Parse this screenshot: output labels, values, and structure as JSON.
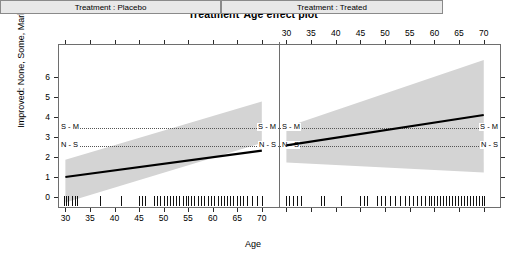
{
  "title": "Treatment*Age effect plot",
  "axes": {
    "xlabel": "Age",
    "ylabel": "Improved: None, Some, Marked",
    "x_ticks": [
      30,
      35,
      40,
      45,
      50,
      55,
      60,
      65,
      70
    ],
    "y_ticks": [
      0,
      1,
      2,
      3,
      4,
      5,
      6
    ],
    "xlim": [
      28.5,
      73.5
    ],
    "ylim": [
      -0.55,
      6.95
    ],
    "bottom_labels_panel": "left",
    "top_labels_panel": "right",
    "grid": false
  },
  "panels": [
    {
      "id": "placebo",
      "strip_label": "Treatment : Placebo"
    },
    {
      "id": "treated",
      "strip_label": "Treatment : Treated"
    }
  ],
  "thresholds": [
    {
      "label": "S - M",
      "value": 3.45
    },
    {
      "label": "N - S",
      "value": 2.55
    }
  ],
  "colors": {
    "line": "#000000",
    "band": "#d4d4d4",
    "strip_bg": "#e8e8e8",
    "frame": "#6e6e6e",
    "threshold": "#555555",
    "rug": "#111111"
  },
  "chart_data": {
    "type": "line",
    "title": "Treatment*Age effect plot",
    "xlabel": "Age",
    "ylabel": "Improved: None, Some, Marked",
    "xlim": [
      28.5,
      73.5
    ],
    "ylim": [
      -0.55,
      6.95
    ],
    "xticks": [
      30,
      35,
      40,
      45,
      50,
      55,
      60,
      65,
      70
    ],
    "yticks": [
      0,
      1,
      2,
      3,
      4,
      5,
      6
    ],
    "grid": false,
    "legend": "none",
    "facet_variable": "Treatment",
    "annotations": [
      {
        "text": "S - M",
        "y": 3.45,
        "style": "dotted-hline"
      },
      {
        "text": "N - S",
        "y": 2.55,
        "style": "dotted-hline"
      }
    ],
    "series": [
      {
        "name": "Treatment : Placebo",
        "panel": "placebo",
        "x": [
          30,
          70
        ],
        "values": [
          1.0,
          2.32
        ],
        "band_upper": [
          1.86,
          4.78
        ],
        "band_lower": [
          -0.28,
          2.7
        ],
        "band_label": "95% confidence band"
      },
      {
        "name": "Treatment : Treated",
        "panel": "treated",
        "x": [
          30,
          70
        ],
        "values": [
          2.58,
          4.1
        ],
        "band_upper": [
          3.5,
          6.85
        ],
        "band_lower": [
          1.72,
          1.22
        ],
        "band_label": "95% confidence band"
      }
    ],
    "rug_placebo": [
      29.8,
      30.2,
      30.6,
      31.4,
      32.0,
      32.4,
      37.1,
      41.4,
      45.0,
      45.6,
      46.2,
      48.0,
      48.6,
      49.2,
      50.0,
      50.6,
      51.2,
      52.0,
      52.6,
      53.2,
      54.0,
      54.6,
      55.0,
      55.6,
      56.2,
      57.0,
      57.6,
      58.2,
      59.0,
      59.6,
      60.2,
      61.0,
      61.6,
      62.2,
      63.0,
      63.6,
      64.2,
      65.0,
      65.6,
      66.2,
      67.0,
      68.0,
      69.0,
      70.0
    ],
    "rug_treated": [
      29.9,
      30.6,
      31.4,
      32.2,
      33.0,
      37.0,
      37.6,
      41.0,
      45.0,
      45.8,
      46.4,
      48.4,
      49.2,
      50.0,
      51.0,
      52.0,
      53.0,
      54.0,
      54.8,
      55.6,
      56.4,
      57.2,
      58.0,
      58.8,
      59.4,
      60.0,
      60.6,
      61.2,
      61.8,
      62.4,
      63.0,
      63.6,
      64.2,
      64.8,
      65.4,
      66.0,
      66.6,
      67.2,
      67.8,
      68.4,
      69.0,
      69.6,
      70.0
    ]
  }
}
